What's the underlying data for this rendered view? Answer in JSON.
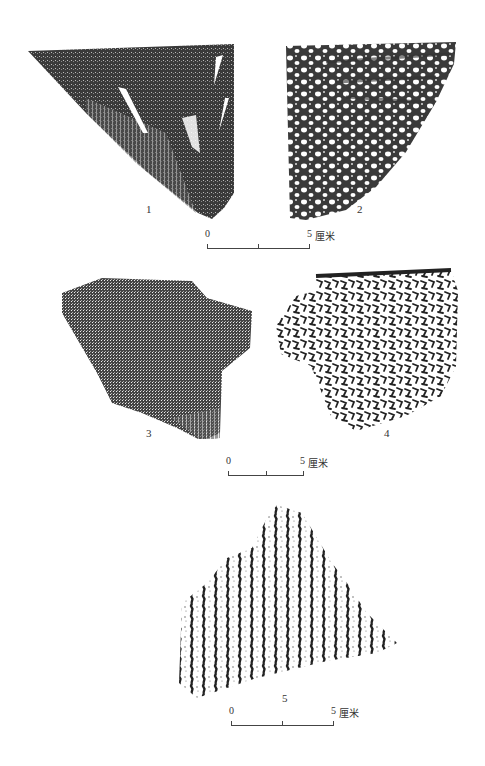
{
  "figure": {
    "sherds": [
      {
        "id": 1,
        "label": "1",
        "pattern": "dense-cord-mark-with-incised-strokes"
      },
      {
        "id": 2,
        "label": "2",
        "pattern": "mottled-net-impression"
      },
      {
        "id": 3,
        "label": "3",
        "pattern": "dense-fine-cord-mark"
      },
      {
        "id": 4,
        "label": "4",
        "pattern": "sparse-net-pattern"
      },
      {
        "id": 5,
        "label": "5",
        "pattern": "vertical-cord-mark"
      }
    ],
    "scalebars": [
      {
        "zero": "0",
        "five": "5",
        "unit": "厘米"
      },
      {
        "zero": "0",
        "five": "5",
        "unit": "厘米"
      },
      {
        "zero": "0",
        "five": "5",
        "unit": "厘米"
      }
    ],
    "colors": {
      "ink": "#2a2a2a",
      "paper": "#ffffff"
    }
  }
}
